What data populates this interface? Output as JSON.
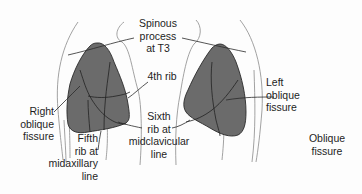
{
  "diagram": {
    "colors": {
      "lung_fill": "#6b6b6b",
      "lung_stroke": "#2a2a2a",
      "body_outline": "#8a8a8a",
      "leader_line": "#2a2a2a",
      "text": "#1e1e1e",
      "background": "#fdfdfd"
    },
    "labels": {
      "spinous_process": [
        "Spinous",
        "process",
        "at T3"
      ],
      "fourth_rib": [
        "4th rib"
      ],
      "right_oblique_fissure": [
        "Right",
        "oblique",
        "fissure"
      ],
      "fifth_rib": [
        "Fifth",
        "rib at",
        "midaxillary",
        "line"
      ],
      "sixth_rib": [
        "Sixth",
        "rib at",
        "midclavicular",
        "line"
      ],
      "left_oblique_fissure": [
        "Left",
        "oblique",
        "fissure"
      ],
      "oblique_fissure": [
        "Oblique",
        "fissure"
      ]
    },
    "structures": [
      {
        "name": "right-lung",
        "side": "image-left"
      },
      {
        "name": "left-lung",
        "side": "image-right"
      }
    ]
  }
}
